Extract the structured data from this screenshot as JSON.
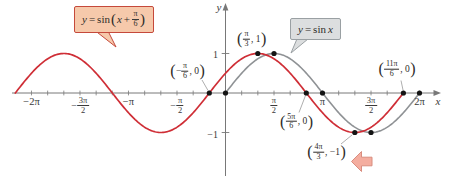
{
  "axes": {
    "x_label": "x",
    "y_label": "y",
    "y_tick_labels": [
      "1",
      "-1"
    ]
  },
  "x_tick_labels": [
    {
      "value_pi": -2,
      "plain": "−2π"
    },
    {
      "value_pi": -1.5,
      "sign": "−",
      "num": "3π",
      "den": "2"
    },
    {
      "value_pi": -1,
      "plain": "−π"
    },
    {
      "value_pi": -0.5,
      "sign": "−",
      "num": "π",
      "den": "2"
    },
    {
      "value_pi": 0.5,
      "num": "π",
      "den": "2"
    },
    {
      "value_pi": 1,
      "plain": "π"
    },
    {
      "value_pi": 1.5,
      "num": "3π",
      "den": "2"
    },
    {
      "value_pi": 2,
      "plain": "2π"
    }
  ],
  "red_curve_callout": {
    "y": "y",
    "eq": "=",
    "fn": "sin",
    "open": "(",
    "arg": "x",
    "plus": "+",
    "num": "π",
    "den": "6",
    "close": ")"
  },
  "gray_curve_callout": {
    "y": "y",
    "eq": "=",
    "fn": "sin",
    "arg": "x"
  },
  "colors": {
    "red_curve": "#cf2e36",
    "gray_curve": "#8f9295",
    "axis": "#787878",
    "dot": "#141414",
    "red_box_fill": "#f6c9ab",
    "red_box_border": "#c5493b",
    "gray_box_fill": "#dcdedf",
    "gray_box_border": "#9aa0a3",
    "arrow_fill": "#f4ad9f",
    "arrow_border": "#d98d7f",
    "connector": "#999999",
    "text": "#2e2b28"
  },
  "chart_data": {
    "type": "line",
    "title": "",
    "xlabel": "x",
    "ylabel": "y",
    "xlim_pi": [
      -2.33,
      2.33
    ],
    "ylim": [
      -1,
      1
    ],
    "x_tick_step_pi": 0.16667,
    "x_label_step_pi": 0.5,
    "grid": false,
    "series": [
      {
        "name": "y = sin(x + π/6)",
        "color": "#cf2e36",
        "amplitude": 1,
        "period_pi": 2,
        "phase_pi": 0.166667,
        "domain_pi": [
          -2.166667,
          1.833333
        ]
      },
      {
        "name": "y = sin x",
        "color": "#8f9295",
        "amplitude": 1,
        "period_pi": 2,
        "phase_pi": 0,
        "domain_pi": [
          0,
          2
        ]
      }
    ],
    "marked_points_pi": [
      [
        -0.166667,
        0
      ],
      [
        0,
        0
      ],
      [
        0.333333,
        1
      ],
      [
        0.5,
        1
      ],
      [
        0.833333,
        0
      ],
      [
        1,
        0
      ],
      [
        1.333333,
        -1
      ],
      [
        1.5,
        -1
      ],
      [
        1.833333,
        0
      ],
      [
        2,
        0
      ]
    ],
    "labeled_points": [
      {
        "x_pi": -0.166667,
        "y": 0,
        "text": "(−π/6, 0)",
        "sign": "−",
        "num": "π",
        "den": "6",
        "rest": ", 0"
      },
      {
        "x_pi": 0.333333,
        "y": 1,
        "text": "(π/3, 1)",
        "num": "π",
        "den": "3",
        "rest": ", 1"
      },
      {
        "x_pi": 0.833333,
        "y": 0,
        "text": "(5π/6, 0)",
        "num": "5π",
        "den": "6",
        "rest": ", 0"
      },
      {
        "x_pi": 1.333333,
        "y": -1,
        "text": "(4π/3, −1)",
        "num": "4π",
        "den": "3",
        "rest": ", −1"
      },
      {
        "x_pi": 1.833333,
        "y": 0,
        "text": "(11π/6, 0)",
        "num": "11π",
        "den": "6",
        "rest": ", 0"
      }
    ]
  }
}
